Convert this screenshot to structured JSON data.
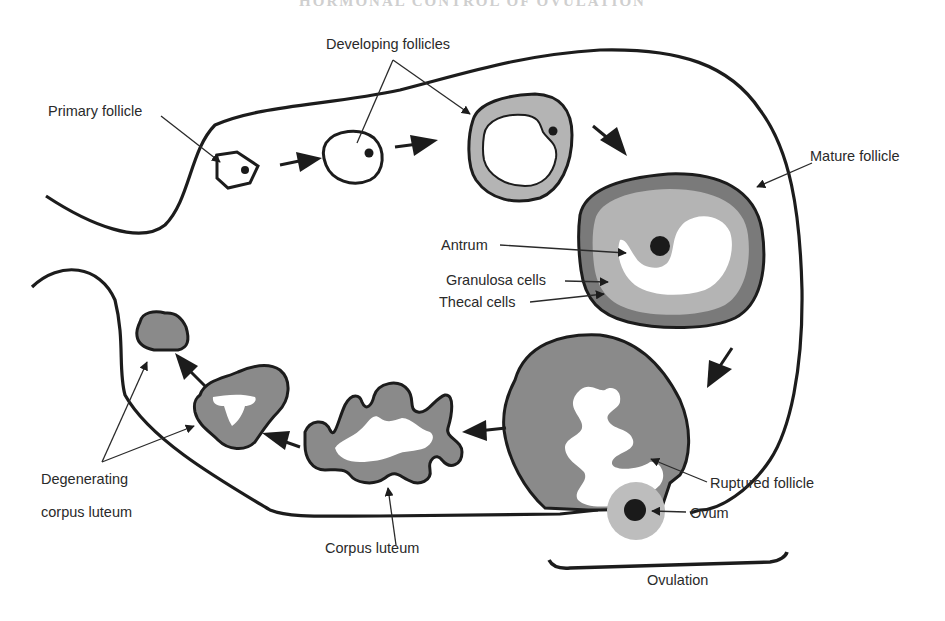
{
  "page_header": "HORMONAL CONTROL OF OVULATION",
  "figure": {
    "type": "ovarian cycle diagram",
    "colors": {
      "outline": "#1c1c1c",
      "thecal": "#7a7a7a",
      "granulosa": "#b4b4b4",
      "luteal": "#8a8a8a",
      "antrum": "#ffffff",
      "nucleus": "#1a1a1a",
      "ovum_halo": "#bdbdbd"
    },
    "labels": {
      "primary_follicle": "Primary follicle",
      "developing_follicles": "Developing follicles",
      "mature_follicle": "Mature follicle",
      "antrum": "Antrum",
      "granulosa_cells": "Granulosa cells",
      "thecal_cells": "Thecal cells",
      "ruptured_follicle": "Ruptured follicle",
      "ovum": "Ovum",
      "ovulation": "Ovulation",
      "corpus_luteum": "Corpus luteum",
      "degenerating_line1": "Degenerating",
      "degenerating_line2": "corpus luteum"
    },
    "stages": [
      "Primary follicle",
      "Developing follicles",
      "Mature follicle",
      "Ruptured follicle",
      "Ovum",
      "Corpus luteum",
      "Degenerating corpus luteum"
    ]
  }
}
